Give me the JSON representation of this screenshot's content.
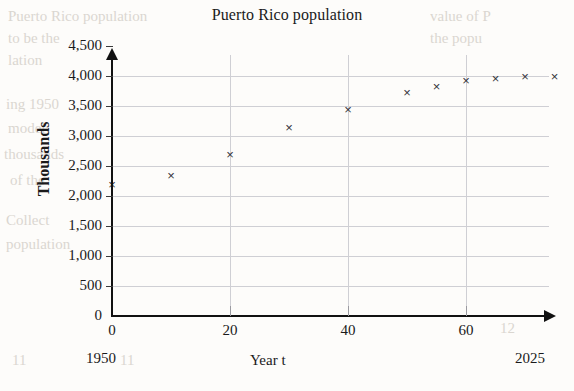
{
  "chart_data": {
    "type": "scatter",
    "title": "Puerto Rico population",
    "xlabel": "Year t",
    "ylabel": "Thousands",
    "xlim": [
      0,
      75
    ],
    "ylim": [
      0,
      4500
    ],
    "grid": true,
    "legend": "none",
    "x_ticks": [
      "0",
      "20",
      "40",
      "60"
    ],
    "x_tick_values": [
      0,
      20,
      40,
      60
    ],
    "y_ticks": [
      "0",
      "500",
      "1,000",
      "1,500",
      "2,000",
      "2,500",
      "3,000",
      "3,500",
      "4,000",
      "4,500"
    ],
    "y_tick_values": [
      0,
      500,
      1000,
      1500,
      2000,
      2500,
      3000,
      3500,
      4000,
      4500
    ],
    "x_axis_start_annotation": "1950",
    "x_axis_end_annotation": "2025",
    "marker": "x",
    "marker_color": "#35353a",
    "x": [
      0,
      10,
      20,
      30,
      40,
      50,
      55,
      60,
      65,
      70,
      75
    ],
    "y": [
      2200,
      2350,
      2690,
      3150,
      3450,
      3720,
      3820,
      3920,
      3960,
      4000,
      3990
    ],
    "points": [
      {
        "x": 0,
        "y": 2200
      },
      {
        "x": 10,
        "y": 2350
      },
      {
        "x": 20,
        "y": 2690
      },
      {
        "x": 30,
        "y": 3150
      },
      {
        "x": 40,
        "y": 3450
      },
      {
        "x": 50,
        "y": 3720
      },
      {
        "x": 55,
        "y": 3820
      },
      {
        "x": 60,
        "y": 3920
      },
      {
        "x": 65,
        "y": 3960
      },
      {
        "x": 70,
        "y": 4000
      },
      {
        "x": 75,
        "y": 3990
      }
    ]
  },
  "background_text": [
    {
      "text": "Puerto Rico population",
      "x": 8,
      "y": 8
    },
    {
      "text": "value of P",
      "x": 430,
      "y": 8
    },
    {
      "text": "to be the",
      "x": 8,
      "y": 30
    },
    {
      "text": "the popu",
      "x": 430,
      "y": 30
    },
    {
      "text": "lation",
      "x": 8,
      "y": 52
    },
    {
      "text": "ing 1950",
      "x": 6,
      "y": 96
    },
    {
      "text": "model",
      "x": 8,
      "y": 120
    },
    {
      "text": "thousands",
      "x": 4,
      "y": 146
    },
    {
      "text": "of the",
      "x": 10,
      "y": 172
    },
    {
      "text": "Collect",
      "x": 6,
      "y": 212
    },
    {
      "text": "population",
      "x": 6,
      "y": 236
    },
    {
      "text": "11",
      "x": 12,
      "y": 352
    },
    {
      "text": "11",
      "x": 120,
      "y": 352
    },
    {
      "text": "12",
      "x": 500,
      "y": 320
    }
  ]
}
